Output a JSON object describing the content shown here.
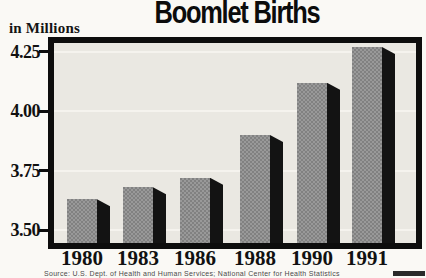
{
  "title": "Boomlet Births",
  "unit_label": "in Millions",
  "source_caption": "Source: U.S. Dept. of Health and Human Services; National Center for Health Statistics",
  "chart_data": {
    "type": "bar",
    "title": "Boomlet Births",
    "ylabel": "in Millions",
    "categories": [
      "1980",
      "1983",
      "1986",
      "1988",
      "1990",
      "1991"
    ],
    "values": [
      3.63,
      3.68,
      3.72,
      3.9,
      4.12,
      4.27
    ],
    "yticks": [
      3.5,
      3.75,
      4.0,
      4.25
    ],
    "ytick_labels": [
      "3.50",
      "3.75",
      "4.00",
      "4.25"
    ],
    "ylim": [
      3.446,
      4.287
    ],
    "grid": true,
    "legend": "none",
    "style": "3d-bars-gray-with-black-side"
  },
  "colors": {
    "page_bg": "#faf9f5",
    "plot_bg": "#eae8e2",
    "frame": "#0d0d0d",
    "bar_fill": "#8f8f8f",
    "bar_side": "#141414",
    "gridline": "#f5f3ee",
    "text": "#111111"
  }
}
